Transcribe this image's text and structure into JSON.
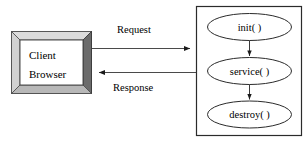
{
  "diagram": {
    "type": "flow-diagram",
    "background_color": "#ffffff",
    "stroke_color": "#000000",
    "client": {
      "name": "client-browser-box",
      "line1": "Client",
      "line2": "Browser",
      "bevel_top_color": "#d9d9d9",
      "bevel_left_color": "#d0d0d0",
      "bevel_right_color": "#6e6e6e",
      "bevel_bottom_color": "#b5b5b5",
      "fill_color": "#ffffff"
    },
    "server": {
      "name": "server-container-box",
      "fill_color": "#ffffff",
      "nodes": [
        {
          "id": "init",
          "label": "init( )"
        },
        {
          "id": "service",
          "label": "service( )"
        },
        {
          "id": "destroy",
          "label": "destroy( )"
        }
      ]
    },
    "edges": [
      {
        "id": "request",
        "label": "Request",
        "direction": "client-to-server"
      },
      {
        "id": "response",
        "label": "Response",
        "direction": "server-to-client"
      },
      {
        "id": "init-to-service",
        "label": "",
        "direction": "down"
      },
      {
        "id": "service-to-destroy",
        "label": "",
        "direction": "down"
      }
    ]
  }
}
